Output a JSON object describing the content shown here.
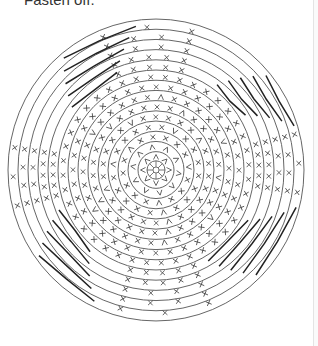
{
  "document": {
    "caption": "Fasten off."
  },
  "diagram": {
    "type": "crochet-round-chart",
    "center": [
      156,
      170
    ],
    "line_color": "#555555",
    "stitch_color": "#444444",
    "magic_ring_radius": 3,
    "ring_radii": [
      9,
      18,
      28,
      38,
      48,
      58,
      68,
      78,
      88,
      98,
      108,
      118,
      128,
      138,
      148
    ],
    "spokes_round_1": 8,
    "symbol_legend": [
      {
        "symbol": "x",
        "name": "single crochet"
      },
      {
        "symbol": "v",
        "name": "increase (2 sc in same st)"
      },
      {
        "symbol": "^",
        "name": "decrease (sc2tog)"
      },
      {
        "symbol": "—",
        "name": "slip stitch / long stitch segments on outer rounds"
      }
    ],
    "stitch_rounds": [
      {
        "radius": 13,
        "count": 8,
        "symbol": "v"
      },
      {
        "radius": 23,
        "count": 10,
        "symbol": "v"
      },
      {
        "radius": 33,
        "count": 16,
        "symbol": "x"
      },
      {
        "radius": 43,
        "count": 20,
        "symbol": "x"
      },
      {
        "radius": 53,
        "count": 26,
        "symbol": "x"
      },
      {
        "radius": 63,
        "count": 30,
        "symbol": "x"
      },
      {
        "radius": 73,
        "count": 34,
        "symbol": "x"
      },
      {
        "radius": 83,
        "count": 36,
        "symbol": "x"
      },
      {
        "radius": 93,
        "count": 40,
        "symbol": "x"
      }
    ],
    "x_wedge_rounds": [
      {
        "radius": 103,
        "count": 20
      },
      {
        "radius": 113,
        "count": 20
      },
      {
        "radius": 123,
        "count": 16
      },
      {
        "radius": 133,
        "count": 14
      },
      {
        "radius": 143,
        "count": 12
      }
    ]
  }
}
